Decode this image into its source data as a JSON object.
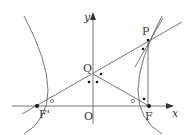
{
  "diagram": {
    "type": "hyperbola-geometry",
    "axes": {
      "x_label": "x",
      "y_label": "y",
      "origin_label": "O"
    },
    "points": {
      "P": {
        "label": "P"
      },
      "Q": {
        "label": "Q"
      },
      "F": {
        "label": "F"
      },
      "F_prime": {
        "label": "F'"
      },
      "O": {
        "label": "O"
      }
    },
    "markers": {
      "angle_circle_left": "○",
      "angle_circle_right": "○",
      "equal_angle_dots": "•"
    },
    "colors": {
      "stroke": "#555555",
      "text": "#333333",
      "dot": "#111111"
    }
  }
}
